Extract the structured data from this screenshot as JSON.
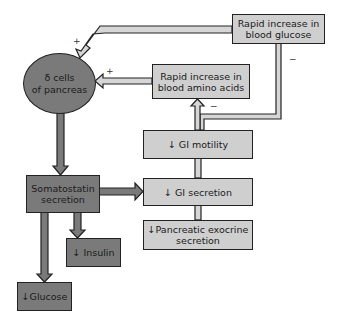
{
  "nodes": {
    "delta_cells": {
      "line1": "δ cells",
      "line2": "of pancreas"
    },
    "blood_glucose": {
      "line1": "Rapid increase in",
      "line2": "blood glucose"
    },
    "amino_acids": {
      "line1": "Rapid increase in",
      "line2": "blood amino acids"
    },
    "gi_motility": {
      "label": "↓ GI motility"
    },
    "gi_secretion": {
      "label": "↓ GI secretion"
    },
    "pancreatic_exocrine": {
      "line1": "↓Pancreatic exocrine",
      "line2": "secretion"
    },
    "somatostatin": {
      "line1": "Somatostatin",
      "line2": "secretion"
    },
    "insulin": {
      "label": "↓ Insulin"
    },
    "glucose": {
      "label": "↓Glucose"
    }
  },
  "signs": {
    "glucose_to_delta": "+",
    "amino_to_delta": "+",
    "feedback_glucose": "−",
    "feedback_amino": "−"
  },
  "colors": {
    "light_fill": "#cfcfcf",
    "dark_fill": "#7a7a7a",
    "outline": "#222222"
  }
}
